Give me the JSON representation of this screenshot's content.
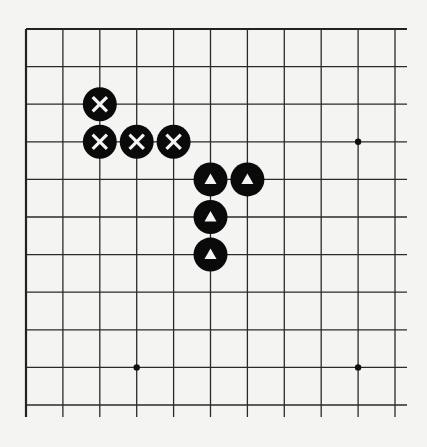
{
  "diagram": {
    "type": "go-board-fragment",
    "colors": {
      "background": "#f4f4f2",
      "line": "#2a2a2a",
      "stone": "#0a0a0a",
      "mark": "#f4f4f2"
    },
    "grid": {
      "columns": 11,
      "rows": 11,
      "origin_x": 26,
      "origin_y": 29,
      "spacing_x": 36.9,
      "spacing_y": 37.6,
      "closed_edges": [
        "top",
        "left"
      ],
      "open_edges": [
        "right",
        "bottom"
      ],
      "overhang": 12
    },
    "star_points": [
      {
        "col": 9,
        "row": 3
      },
      {
        "col": 3,
        "row": 9
      },
      {
        "col": 9,
        "row": 9
      }
    ],
    "stones": [
      {
        "col": 2,
        "row": 2,
        "color": "black",
        "mark": "x"
      },
      {
        "col": 2,
        "row": 3,
        "color": "black",
        "mark": "x"
      },
      {
        "col": 3,
        "row": 3,
        "color": "black",
        "mark": "x"
      },
      {
        "col": 4,
        "row": 3,
        "color": "black",
        "mark": "x"
      },
      {
        "col": 5,
        "row": 4,
        "color": "black",
        "mark": "triangle"
      },
      {
        "col": 6,
        "row": 4,
        "color": "black",
        "mark": "triangle"
      },
      {
        "col": 5,
        "row": 5,
        "color": "black",
        "mark": "triangle"
      },
      {
        "col": 5,
        "row": 6,
        "color": "black",
        "mark": "triangle"
      }
    ],
    "stone_radius": 17
  }
}
